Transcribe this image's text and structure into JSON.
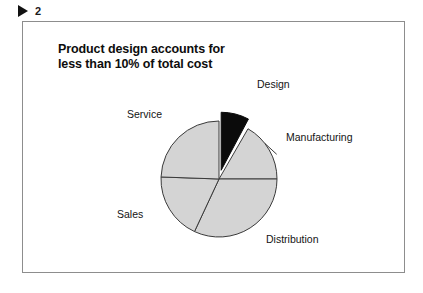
{
  "top_marker": {
    "icon": "play-triangle-icon",
    "number": "2"
  },
  "figure": {
    "title": "Product design accounts for\nless than 10% of total cost",
    "background_color": "#ffffff",
    "border_color": "#8d8d8d"
  },
  "chart_data": {
    "type": "pie",
    "title": "Product design accounts for less than 10% of total cost",
    "categories": [
      "Design",
      "Manufacturing",
      "Distribution",
      "Sales",
      "Service"
    ],
    "values": [
      8,
      17,
      32,
      19,
      24
    ],
    "unit": "percent of total cost",
    "colors": [
      "#0b0b0b",
      "#d4d4d4",
      "#d4d4d4",
      "#d4d4d4",
      "#d4d4d4"
    ],
    "exploded_slices": [
      "Design"
    ],
    "start_angle_deg": 0,
    "direction": "clockwise",
    "legend": "none",
    "labels_position": "outside",
    "grid": false,
    "slices": [
      {
        "name": "Design",
        "value": 8,
        "start_deg": 0,
        "end_deg": 28,
        "exploded": true,
        "color": "#0b0b0b",
        "label_x": 234,
        "label_y": 66
      },
      {
        "name": "Manufacturing",
        "value": 17,
        "start_deg": 30,
        "end_deg": 90,
        "exploded": false,
        "color": "#d4d4d4",
        "label_x": 263,
        "label_y": 119
      },
      {
        "name": "Distribution",
        "value": 32,
        "start_deg": 90,
        "end_deg": 205,
        "exploded": false,
        "color": "#d4d4d4",
        "label_x": 243,
        "label_y": 221
      },
      {
        "name": "Sales",
        "value": 19,
        "start_deg": 205,
        "end_deg": 272,
        "exploded": false,
        "color": "#d4d4d4",
        "label_x": 94,
        "label_y": 196
      },
      {
        "name": "Service",
        "value": 24,
        "start_deg": 272,
        "end_deg": 360,
        "exploded": false,
        "color": "#d4d4d4",
        "label_x": 104,
        "label_y": 96
      }
    ]
  }
}
